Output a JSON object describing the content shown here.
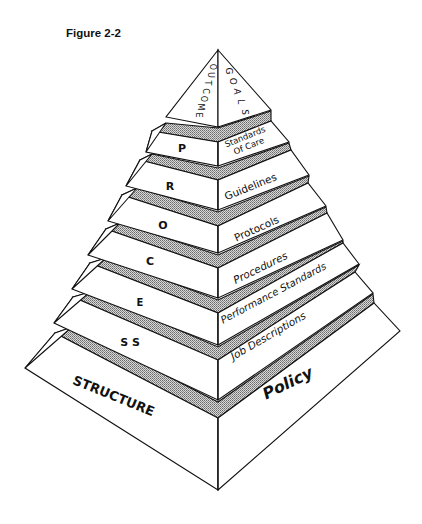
{
  "figure": {
    "label": "Figure 2-2"
  },
  "diagram": {
    "type": "pyramid",
    "cap": {
      "left_text": "OUTCOME",
      "right_text": "GOALS"
    },
    "levels": [
      {
        "left": "P",
        "right_lines": [
          "Standards",
          "Of Care"
        ]
      },
      {
        "left": "R",
        "right_lines": [
          "Guidelines"
        ]
      },
      {
        "left": "O",
        "right_lines": [
          "Protocols"
        ]
      },
      {
        "left": "C",
        "right_lines": [
          "Procedures"
        ]
      },
      {
        "left": "E",
        "right_lines": [
          "Performance Standards"
        ]
      },
      {
        "left": "S S",
        "right_lines": [
          "Job Descriptions"
        ]
      },
      {
        "left": "STRUCTURE",
        "right_lines": [
          "Policy"
        ]
      }
    ],
    "colors": {
      "line": "#111111",
      "face": "#ffffff",
      "hatch": "#9a9a9a"
    }
  }
}
